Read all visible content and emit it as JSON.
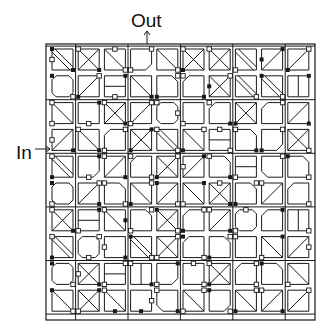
{
  "labels": {
    "out": "Out",
    "in": "In"
  },
  "colors": {
    "line": "#1a1a1a",
    "background": "#ffffff",
    "node_fill": "#ffffff",
    "dot_fill": "#1a1a1a"
  },
  "grid": {
    "rows": 10,
    "cols": 10,
    "outer_border": {
      "x": 46,
      "y": 44,
      "w": 269,
      "h": 276
    },
    "origin": {
      "x": 52,
      "y": 49
    },
    "pitch_x": 26.2,
    "pitch_y": 26.8,
    "cell_size": 21,
    "motif_legend": {
      "d": "diagonal TL-BR",
      "a": "diagonal TR-BL",
      "x": "cross",
      "dd": "double diagonal TL-BR",
      "aa": "double diagonal TR-BL",
      "o": "octagon",
      "c1": "chamfer top-left",
      "c2": "chamfer top-right",
      "c3": "chamfer bottom-right",
      "c4": "chamfer bottom-left",
      "v": "vertical bar",
      "h": "horizontal bar",
      "e": "empty"
    },
    "cells": [
      [
        "dd",
        "x",
        "d",
        "c3",
        "d",
        "x",
        "x",
        "dd",
        "a",
        "a"
      ],
      [
        "o",
        "a",
        "h",
        "d",
        "c2",
        "c1",
        "x",
        "dd",
        "dd",
        "v"
      ],
      [
        "d",
        "e",
        "x",
        "a",
        "o",
        "e",
        "c1",
        "x",
        "c1",
        "a"
      ],
      [
        "a",
        "d",
        "c1",
        "x",
        "dd",
        "d",
        "h",
        "c2",
        "c3",
        "x"
      ],
      [
        "dd",
        "c3",
        "a",
        "c1",
        "x",
        "a",
        "c2",
        "h",
        "c4",
        "c2"
      ],
      [
        "o",
        "a",
        "c2",
        "d",
        "a",
        "d",
        "x",
        "c2",
        "a",
        "c1"
      ],
      [
        "x",
        "h",
        "d",
        "c2",
        "x",
        "c1",
        "a",
        "o",
        "c1",
        "v"
      ],
      [
        "dd",
        "o",
        "e",
        "dd",
        "x",
        "c1",
        "c2",
        "e",
        "d",
        "a"
      ],
      [
        "o",
        "x",
        "h",
        "v",
        "c3",
        "e",
        "x",
        "c1",
        "c2",
        "d"
      ],
      [
        "d",
        "x",
        "d",
        "e",
        "c4",
        "d",
        "c3",
        "d",
        "a",
        "a"
      ]
    ],
    "nodes": [
      [
        0,
        0,
        "tl",
        "dot"
      ],
      [
        0,
        0,
        "l",
        "sq"
      ],
      [
        0,
        0,
        "br",
        "dot"
      ],
      [
        0,
        1,
        "tl",
        "sq"
      ],
      [
        0,
        1,
        "br",
        "dot"
      ],
      [
        0,
        2,
        "t",
        "sq"
      ],
      [
        0,
        2,
        "br",
        "sq"
      ],
      [
        0,
        3,
        "tr",
        "sq"
      ],
      [
        0,
        3,
        "bl",
        "sq"
      ],
      [
        0,
        4,
        "br",
        "sq"
      ],
      [
        0,
        5,
        "tl",
        "sq"
      ],
      [
        0,
        5,
        "bl",
        "dot"
      ],
      [
        0,
        6,
        "tl",
        "sq"
      ],
      [
        0,
        7,
        "bl",
        "sq"
      ],
      [
        0,
        8,
        "tr",
        "dot"
      ],
      [
        0,
        8,
        "l",
        "dot"
      ],
      [
        0,
        9,
        "tr",
        "sq"
      ],
      [
        0,
        9,
        "bl",
        "dot"
      ],
      [
        1,
        0,
        "tl",
        "dot"
      ],
      [
        1,
        0,
        "br",
        "sq"
      ],
      [
        1,
        1,
        "tr",
        "sq"
      ],
      [
        1,
        1,
        "bl",
        "dot"
      ],
      [
        1,
        2,
        "tr",
        "dot"
      ],
      [
        1,
        2,
        "b",
        "sq"
      ],
      [
        1,
        3,
        "br",
        "dot"
      ],
      [
        1,
        4,
        "tr",
        "sq"
      ],
      [
        1,
        4,
        "bl",
        "dot"
      ],
      [
        1,
        5,
        "tl",
        "sq"
      ],
      [
        1,
        5,
        "br",
        "dot"
      ],
      [
        1,
        6,
        "tr",
        "sq"
      ],
      [
        1,
        6,
        "l",
        "dot"
      ],
      [
        1,
        7,
        "br",
        "sq"
      ],
      [
        1,
        8,
        "tl",
        "dot"
      ],
      [
        1,
        8,
        "br",
        "sq"
      ],
      [
        1,
        9,
        "tr",
        "dot"
      ],
      [
        2,
        0,
        "tl",
        "sq"
      ],
      [
        2,
        0,
        "bl",
        "sq"
      ],
      [
        2,
        1,
        "b",
        "sq"
      ],
      [
        2,
        1,
        "tr",
        "dot"
      ],
      [
        2,
        2,
        "tl",
        "sq"
      ],
      [
        2,
        2,
        "br",
        "dot"
      ],
      [
        2,
        3,
        "tr",
        "sq"
      ],
      [
        2,
        3,
        "bl",
        "sq"
      ],
      [
        2,
        4,
        "tl",
        "sq"
      ],
      [
        2,
        4,
        "r",
        "sq"
      ],
      [
        2,
        5,
        "bl",
        "sq"
      ],
      [
        2,
        6,
        "tl",
        "sq"
      ],
      [
        2,
        6,
        "br",
        "dot"
      ],
      [
        2,
        7,
        "bl",
        "dot"
      ],
      [
        2,
        8,
        "tr",
        "sq"
      ],
      [
        2,
        9,
        "br",
        "dot"
      ],
      [
        3,
        0,
        "l",
        "sq"
      ],
      [
        3,
        0,
        "br",
        "dot"
      ],
      [
        3,
        1,
        "tl",
        "sq"
      ],
      [
        3,
        1,
        "br",
        "dot"
      ],
      [
        3,
        2,
        "tr",
        "sq"
      ],
      [
        3,
        2,
        "bl",
        "sq"
      ],
      [
        3,
        3,
        "tr",
        "dot"
      ],
      [
        3,
        3,
        "bl",
        "dot"
      ],
      [
        3,
        4,
        "tl",
        "sq"
      ],
      [
        3,
        4,
        "br",
        "sq"
      ],
      [
        3,
        5,
        "tr",
        "sq"
      ],
      [
        3,
        5,
        "bl",
        "dot"
      ],
      [
        3,
        6,
        "t",
        "sq"
      ],
      [
        3,
        6,
        "br",
        "sq"
      ],
      [
        3,
        7,
        "tl",
        "sq"
      ],
      [
        3,
        7,
        "br",
        "dot"
      ],
      [
        3,
        8,
        "tr",
        "sq"
      ],
      [
        3,
        8,
        "bl",
        "dot"
      ],
      [
        3,
        9,
        "br",
        "sq"
      ],
      [
        4,
        0,
        "tl",
        "sq"
      ],
      [
        4,
        0,
        "bl",
        "dot"
      ],
      [
        4,
        1,
        "tr",
        "dot"
      ],
      [
        4,
        1,
        "b",
        "sq"
      ],
      [
        4,
        2,
        "tl",
        "sq"
      ],
      [
        4,
        2,
        "br",
        "dot"
      ],
      [
        4,
        3,
        "tl",
        "sq"
      ],
      [
        4,
        3,
        "br",
        "sq"
      ],
      [
        4,
        4,
        "tr",
        "sq"
      ],
      [
        4,
        4,
        "bl",
        "dot"
      ],
      [
        4,
        5,
        "tr",
        "dot"
      ],
      [
        4,
        5,
        "l",
        "sq"
      ],
      [
        4,
        6,
        "tl",
        "sq"
      ],
      [
        4,
        6,
        "br",
        "dot"
      ],
      [
        4,
        7,
        "bl",
        "sq"
      ],
      [
        4,
        8,
        "tr",
        "sq"
      ],
      [
        4,
        9,
        "tl",
        "dot"
      ],
      [
        4,
        9,
        "br",
        "sq"
      ],
      [
        5,
        0,
        "tl",
        "dot"
      ],
      [
        5,
        0,
        "bl",
        "sq"
      ],
      [
        5,
        1,
        "tr",
        "sq"
      ],
      [
        5,
        1,
        "br",
        "dot"
      ],
      [
        5,
        2,
        "tl",
        "sq"
      ],
      [
        5,
        2,
        "br",
        "sq"
      ],
      [
        5,
        3,
        "tr",
        "sq"
      ],
      [
        5,
        3,
        "bl",
        "dot"
      ],
      [
        5,
        4,
        "tl",
        "dot"
      ],
      [
        5,
        4,
        "br",
        "sq"
      ],
      [
        5,
        5,
        "tr",
        "dot"
      ],
      [
        5,
        5,
        "bl",
        "sq"
      ],
      [
        5,
        6,
        "t",
        "sq"
      ],
      [
        5,
        6,
        "br",
        "dot"
      ],
      [
        5,
        7,
        "tr",
        "sq"
      ],
      [
        5,
        7,
        "bl",
        "dot"
      ],
      [
        5,
        8,
        "tl",
        "sq"
      ],
      [
        5,
        9,
        "br",
        "sq"
      ],
      [
        6,
        0,
        "tl",
        "sq"
      ],
      [
        6,
        0,
        "br",
        "dot"
      ],
      [
        6,
        1,
        "tr",
        "dot"
      ],
      [
        6,
        1,
        "bl",
        "sq"
      ],
      [
        6,
        2,
        "tl",
        "sq"
      ],
      [
        6,
        2,
        "r",
        "dot"
      ],
      [
        6,
        3,
        "tr",
        "sq"
      ],
      [
        6,
        3,
        "bl",
        "sq"
      ],
      [
        6,
        4,
        "tl",
        "dot"
      ],
      [
        6,
        4,
        "br",
        "sq"
      ],
      [
        6,
        5,
        "tr",
        "sq"
      ],
      [
        6,
        5,
        "bl",
        "dot"
      ],
      [
        6,
        6,
        "tl",
        "sq"
      ],
      [
        6,
        6,
        "br",
        "dot"
      ],
      [
        6,
        7,
        "t",
        "sq"
      ],
      [
        6,
        7,
        "bl",
        "sq"
      ],
      [
        6,
        8,
        "tr",
        "dot"
      ],
      [
        6,
        9,
        "br",
        "sq"
      ],
      [
        7,
        0,
        "tl",
        "sq"
      ],
      [
        7,
        0,
        "bl",
        "dot"
      ],
      [
        7,
        1,
        "tr",
        "sq"
      ],
      [
        7,
        1,
        "b",
        "sq"
      ],
      [
        7,
        2,
        "l",
        "sq"
      ],
      [
        7,
        2,
        "br",
        "dot"
      ],
      [
        7,
        3,
        "tl",
        "dot"
      ],
      [
        7,
        3,
        "br",
        "sq"
      ],
      [
        7,
        4,
        "tr",
        "sq"
      ],
      [
        7,
        4,
        "bl",
        "sq"
      ],
      [
        7,
        5,
        "tl",
        "dot"
      ],
      [
        7,
        5,
        "br",
        "sq"
      ],
      [
        7,
        6,
        "tr",
        "sq"
      ],
      [
        7,
        6,
        "bl",
        "dot"
      ],
      [
        7,
        7,
        "tl",
        "sq"
      ],
      [
        7,
        8,
        "tr",
        "dot"
      ],
      [
        7,
        8,
        "bl",
        "sq"
      ],
      [
        7,
        9,
        "r",
        "sq"
      ],
      [
        8,
        0,
        "tl",
        "dot"
      ],
      [
        8,
        0,
        "br",
        "sq"
      ],
      [
        8,
        1,
        "l",
        "sq"
      ],
      [
        8,
        1,
        "br",
        "dot"
      ],
      [
        8,
        2,
        "tr",
        "sq"
      ],
      [
        8,
        2,
        "bl",
        "sq"
      ],
      [
        8,
        3,
        "tl",
        "sq"
      ],
      [
        8,
        3,
        "br",
        "dot"
      ],
      [
        8,
        4,
        "tr",
        "dot"
      ],
      [
        8,
        4,
        "bl",
        "sq"
      ],
      [
        8,
        5,
        "t",
        "sq"
      ],
      [
        8,
        5,
        "br",
        "sq"
      ],
      [
        8,
        6,
        "tl",
        "sq"
      ],
      [
        8,
        6,
        "bl",
        "dot"
      ],
      [
        8,
        7,
        "tr",
        "sq"
      ],
      [
        8,
        7,
        "br",
        "sq"
      ],
      [
        8,
        8,
        "tl",
        "dot"
      ],
      [
        8,
        9,
        "bl",
        "sq"
      ],
      [
        9,
        0,
        "tl",
        "dot"
      ],
      [
        9,
        0,
        "br",
        "sq"
      ],
      [
        9,
        1,
        "tr",
        "dot"
      ],
      [
        9,
        1,
        "bl",
        "sq"
      ],
      [
        9,
        2,
        "tl",
        "sq"
      ],
      [
        9,
        2,
        "b",
        "dot"
      ],
      [
        9,
        3,
        "r",
        "sq"
      ],
      [
        9,
        3,
        "b",
        "dot"
      ],
      [
        9,
        4,
        "tl",
        "sq"
      ],
      [
        9,
        4,
        "br",
        "dot"
      ],
      [
        9,
        5,
        "tr",
        "sq"
      ],
      [
        9,
        5,
        "bl",
        "sq"
      ],
      [
        9,
        6,
        "tl",
        "dot"
      ],
      [
        9,
        6,
        "br",
        "sq"
      ],
      [
        9,
        7,
        "tr",
        "sq"
      ],
      [
        9,
        7,
        "bl",
        "dot"
      ],
      [
        9,
        8,
        "tl",
        "sq"
      ],
      [
        9,
        8,
        "br",
        "dot"
      ],
      [
        9,
        9,
        "tr",
        "sq"
      ]
    ]
  },
  "arrows": {
    "out": {
      "x": 147,
      "y1": 44,
      "y2": 31
    },
    "in": {
      "y": 149,
      "x1": 35,
      "x2": 50
    }
  }
}
